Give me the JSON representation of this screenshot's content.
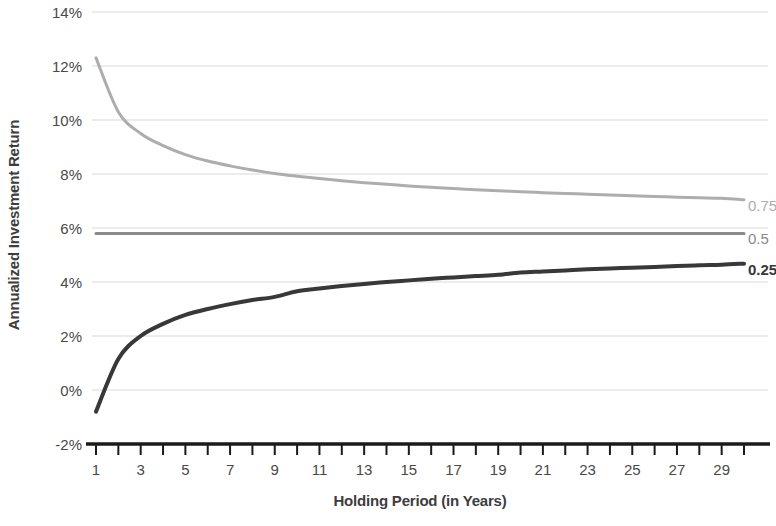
{
  "chart_data": {
    "type": "line",
    "title": "",
    "xlabel": "Holding Period (in Years)",
    "ylabel": "Annualized Investment Return",
    "xlim": [
      1,
      30
    ],
    "ylim": [
      -2,
      14
    ],
    "ytick_labels": [
      "14%",
      "12%",
      "10%",
      "8%",
      "6%",
      "4%",
      "2%",
      "0%",
      "-2%"
    ],
    "ytick_values": [
      14,
      12,
      10,
      8,
      6,
      4,
      2,
      0,
      -2
    ],
    "xtick_labels": [
      "1",
      "3",
      "5",
      "7",
      "9",
      "11",
      "13",
      "15",
      "17",
      "19",
      "21",
      "23",
      "25",
      "27",
      "29"
    ],
    "xtick_values": [
      1,
      3,
      5,
      7,
      9,
      11,
      13,
      15,
      17,
      19,
      21,
      23,
      25,
      27,
      29
    ],
    "x": [
      1,
      2,
      3,
      4,
      5,
      6,
      7,
      8,
      9,
      10,
      11,
      12,
      13,
      14,
      15,
      16,
      17,
      18,
      19,
      20,
      21,
      22,
      23,
      24,
      25,
      26,
      27,
      28,
      29,
      30
    ],
    "grid": "horizontal",
    "legend_position": "right-inline",
    "series": [
      {
        "name": "0.75",
        "label": "0.75",
        "color": "#adadad",
        "bold": false,
        "width": 3,
        "values": [
          12.3,
          10.3,
          9.5,
          9.05,
          8.72,
          8.48,
          8.3,
          8.15,
          8.02,
          7.92,
          7.83,
          7.75,
          7.68,
          7.62,
          7.56,
          7.51,
          7.46,
          7.42,
          7.38,
          7.34,
          7.31,
          7.28,
          7.25,
          7.22,
          7.19,
          7.17,
          7.14,
          7.12,
          7.1,
          7.05
        ]
      },
      {
        "name": "0.5",
        "label": "0.5",
        "color": "#8a8a8a",
        "bold": false,
        "width": 3,
        "values": [
          5.8,
          5.8,
          5.8,
          5.8,
          5.8,
          5.8,
          5.8,
          5.8,
          5.8,
          5.8,
          5.8,
          5.8,
          5.8,
          5.8,
          5.8,
          5.8,
          5.8,
          5.8,
          5.8,
          5.8,
          5.8,
          5.8,
          5.8,
          5.8,
          5.8,
          5.8,
          5.8,
          5.8,
          5.8,
          5.8
        ]
      },
      {
        "name": "0.25",
        "label": "0.25",
        "color": "#383838",
        "bold": true,
        "width": 4,
        "values": [
          -0.8,
          1.15,
          2.0,
          2.45,
          2.78,
          3.0,
          3.18,
          3.33,
          3.45,
          3.66,
          3.76,
          3.85,
          3.93,
          4.0,
          4.06,
          4.12,
          4.17,
          4.22,
          4.27,
          4.35,
          4.39,
          4.43,
          4.47,
          4.5,
          4.53,
          4.56,
          4.59,
          4.62,
          4.64,
          4.68
        ]
      }
    ],
    "colors": {
      "gridline": "#d9d9d9",
      "axis": "#1a1a1a",
      "tick_text": "#494949",
      "title_text": "#3d3d3d"
    }
  }
}
